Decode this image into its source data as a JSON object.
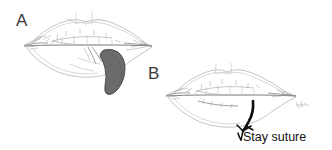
{
  "figure": {
    "background_color": "#ffffff",
    "width": 332,
    "height": 150,
    "style": "pencil line drawing, medical surgical illustration"
  },
  "panels": [
    {
      "id": "panel-a",
      "label": "A",
      "label_x": 16,
      "label_y": 26,
      "description": "Lips with excision defect and dark shaded flap of tissue at lower lip",
      "elements": {
        "lesion_label": "excised tissue flap",
        "lesion_color": "#6b6b6b",
        "lesion_outline_color": "#3f3f3f"
      }
    },
    {
      "id": "panel-b",
      "label": "B",
      "label_x": 148,
      "label_y": 79,
      "description": "Lips after closure with stay suture placed at lower lip",
      "elements": {
        "suture_color": "#0d0d0d"
      }
    }
  ],
  "annotations": [
    {
      "id": "stay-suture-label",
      "text": "Stay suture",
      "x": 243,
      "y": 141,
      "color": "#111111"
    }
  ],
  "colors": {
    "background": "#ffffff",
    "sketch_line": "#b2b2b2",
    "sketch_line_dark": "#6e6e6e",
    "lesion_fill": "#6b6b6b",
    "suture_black": "#0d0d0d",
    "label_text": "#3a3a3a",
    "annotation_text": "#111111"
  }
}
